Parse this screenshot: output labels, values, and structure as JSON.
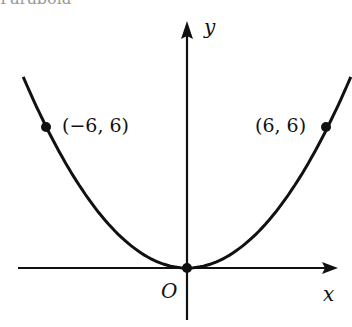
{
  "figure": {
    "title_partial": "Parabola",
    "axes": {
      "x_label": "x",
      "y_label": "y",
      "origin_label": "O"
    },
    "curve": {
      "equation": "y = x^2/6",
      "x_range": [
        -7,
        7
      ]
    },
    "points": [
      {
        "label": "(−6, 6)",
        "x": -6,
        "y": 6
      },
      {
        "label": "(6, 6)",
        "x": 6,
        "y": 6
      },
      {
        "label": "",
        "x": 0,
        "y": 0
      }
    ],
    "colors": {
      "ink": "#111111",
      "background": "#ffffff"
    }
  }
}
